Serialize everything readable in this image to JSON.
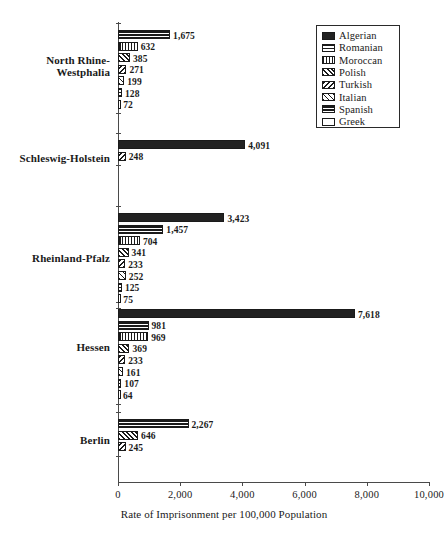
{
  "chart_data": {
    "type": "bar",
    "orientation": "horizontal",
    "title": "",
    "xlabel": "Rate of Imprisonment per 100,000 Population",
    "ylabel": "",
    "xlim": [
      0,
      10000
    ],
    "xticks": [
      "0",
      "2,000",
      "4,000",
      "6,000",
      "8,000",
      "10,000"
    ],
    "xtick_values": [
      0,
      2000,
      4000,
      6000,
      8000,
      10000
    ],
    "grid": false,
    "legend_position": "top-right",
    "categories": [
      "North Rhine-\nWestphalia",
      "Schleswig-Holstein",
      "Rheinland-Pfalz",
      "Hessen",
      "Berlin"
    ],
    "series": [
      {
        "name": "Algerian",
        "pattern": "solid"
      },
      {
        "name": "Romanian",
        "pattern": "hband"
      },
      {
        "name": "Moroccan",
        "pattern": "vline"
      },
      {
        "name": "Polish",
        "pattern": "diag-r"
      },
      {
        "name": "Turkish",
        "pattern": "diag-l"
      },
      {
        "name": "Italian",
        "pattern": "cross"
      },
      {
        "name": "Spanish",
        "pattern": "hthick"
      },
      {
        "name": "Greek",
        "pattern": "white"
      }
    ],
    "groups": [
      {
        "category": "North Rhine-\nWestphalia",
        "bars": [
          {
            "series": "Spanish",
            "value": 1675,
            "label": "1,675",
            "pattern": "hthick"
          },
          {
            "series": "Moroccan",
            "value": 632,
            "label": "632",
            "pattern": "vline"
          },
          {
            "series": "Polish",
            "value": 385,
            "label": "385",
            "pattern": "diag-r"
          },
          {
            "series": "Turkish",
            "value": 271,
            "label": "271",
            "pattern": "diag-l"
          },
          {
            "series": "Italian",
            "value": 199,
            "label": "199",
            "pattern": "cross"
          },
          {
            "series": "Romanian",
            "value": 128,
            "label": "128",
            "pattern": "hband"
          },
          {
            "series": "Greek",
            "value": 72,
            "label": "72",
            "pattern": "white"
          }
        ]
      },
      {
        "category": "Schleswig-Holstein",
        "bars": [
          {
            "series": "Algerian",
            "value": 4091,
            "label": "4,091",
            "pattern": "solid"
          },
          {
            "series": "Turkish",
            "value": 248,
            "label": "248",
            "pattern": "diag-l"
          }
        ]
      },
      {
        "category": "Rheinland-Pfalz",
        "bars": [
          {
            "series": "Algerian",
            "value": 3423,
            "label": "3,423",
            "pattern": "solid"
          },
          {
            "series": "Spanish",
            "value": 1457,
            "label": "1,457",
            "pattern": "hthick"
          },
          {
            "series": "Moroccan",
            "value": 704,
            "label": "704",
            "pattern": "vline"
          },
          {
            "series": "Polish",
            "value": 341,
            "label": "341",
            "pattern": "diag-r"
          },
          {
            "series": "Turkish",
            "value": 233,
            "label": "233",
            "pattern": "diag-l"
          },
          {
            "series": "Italian",
            "value": 252,
            "label": "252",
            "pattern": "cross"
          },
          {
            "series": "Romanian",
            "value": 125,
            "label": "125",
            "pattern": "hband"
          },
          {
            "series": "Greek",
            "value": 75,
            "label": "75",
            "pattern": "white"
          }
        ]
      },
      {
        "category": "Hessen",
        "bars": [
          {
            "series": "Algerian",
            "value": 7618,
            "label": "7,618",
            "pattern": "solid"
          },
          {
            "series": "Spanish",
            "value": 981,
            "label": "981",
            "pattern": "hthick"
          },
          {
            "series": "Moroccan",
            "value": 969,
            "label": "969",
            "pattern": "vline"
          },
          {
            "series": "Polish",
            "value": 369,
            "label": "369",
            "pattern": "diag-r"
          },
          {
            "series": "Turkish",
            "value": 233,
            "label": "233",
            "pattern": "diag-l"
          },
          {
            "series": "Italian",
            "value": 161,
            "label": "161",
            "pattern": "cross"
          },
          {
            "series": "Romanian",
            "value": 107,
            "label": "107",
            "pattern": "hband"
          },
          {
            "series": "Greek",
            "value": 64,
            "label": "64",
            "pattern": "white"
          }
        ]
      },
      {
        "category": "Berlin",
        "bars": [
          {
            "series": "Spanish",
            "value": 2267,
            "label": "2,267",
            "pattern": "hthick"
          },
          {
            "series": "Polish",
            "value": 646,
            "label": "646",
            "pattern": "diag-r"
          },
          {
            "series": "Turkish",
            "value": 245,
            "label": "245",
            "pattern": "diag-l"
          }
        ]
      }
    ]
  },
  "legend": {
    "items": [
      {
        "label": "Algerian",
        "pattern": "solid"
      },
      {
        "label": "Romanian",
        "pattern": "hband"
      },
      {
        "label": "Moroccan",
        "pattern": "vline"
      },
      {
        "label": "Polish",
        "pattern": "diag-r"
      },
      {
        "label": "Turkish",
        "pattern": "diag-l"
      },
      {
        "label": "Italian",
        "pattern": "cross"
      },
      {
        "label": "Spanish",
        "pattern": "hthick"
      },
      {
        "label": "Greek",
        "pattern": "white"
      }
    ]
  },
  "colors": {
    "ink": "#1a1a1a",
    "axis": "#4a4a4a",
    "background": "#ffffff"
  }
}
